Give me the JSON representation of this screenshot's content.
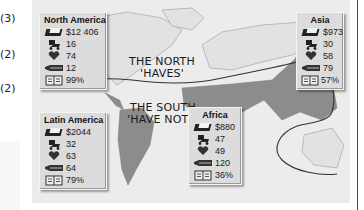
{
  "margin_notes": [
    "(3)",
    "(2)",
    "(2)",
    "(8)"
  ],
  "map": {
    "north_label_line1": "THE NORTH",
    "north_label_line2": "'HAVES'",
    "south_label_line1": "THE SOUTH",
    "south_label_line2": "'HAVE NOTS'",
    "colors": {
      "background": "#ececec",
      "south_land": "#8c8c8c",
      "north_land": "#e2e2e2",
      "divide_line": "#333333"
    }
  },
  "indicator_icons": [
    "money-icon",
    "baby-carriage-icon",
    "heart-icon",
    "coffin-icon",
    "book-icon"
  ],
  "regions": [
    {
      "name": "North America",
      "income": "$12 406",
      "births": "16",
      "life": "74",
      "deaths": "12",
      "literacy": "99%"
    },
    {
      "name": "Latin America",
      "income": "$2044",
      "births": "32",
      "life": "63",
      "deaths": "64",
      "literacy": "79%"
    },
    {
      "name": "Africa",
      "income": "$880",
      "births": "47",
      "life": "49",
      "deaths": "120",
      "literacy": "36%"
    },
    {
      "name": "Asia",
      "income": "$973",
      "births": "30",
      "life": "58",
      "deaths": "79",
      "literacy": "57%"
    }
  ]
}
